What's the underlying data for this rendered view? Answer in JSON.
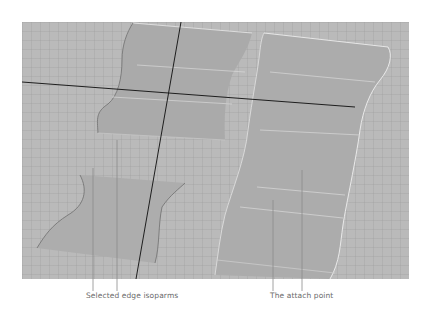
{
  "figure": {
    "type": "3d-viewport-illustration",
    "background_color": "#bababa",
    "surface_color": "#a9a9a9",
    "edge_highlight_color": "#e6e6e6",
    "axis_line_color": "#1e1e1e",
    "leader_line_color": "#8a8a8a"
  },
  "callouts": [
    {
      "id": "selected-edge-isoparms",
      "text": "Selected edge isoparms"
    },
    {
      "id": "attach-point",
      "text": "The attach point"
    }
  ]
}
